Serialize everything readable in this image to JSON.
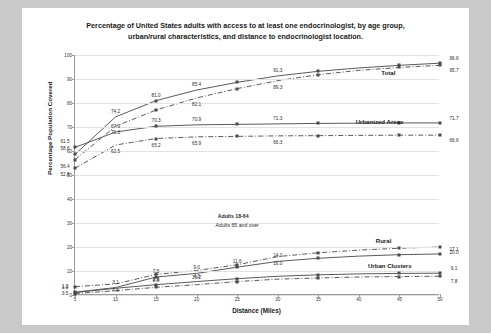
{
  "chart_data": {
    "type": "line",
    "title": "Percentage of United States adults with access to at least one endocrinologist, by age group, urban/rural characteristics, and distance to endocrinologist location.",
    "title_line1": "Percentage of United States adults with access to at least one endocrinologist, by age group,",
    "title_line2": "urban/rural characteristics, and distance to endocrinologist location.",
    "xlabel": "Distance (Miles)",
    "ylabel": "Percentage Population Covered",
    "xlim": [
      5,
      50
    ],
    "ylim": [
      0,
      100
    ],
    "x": [
      5,
      10,
      15,
      20,
      25,
      30,
      35,
      40,
      45,
      50
    ],
    "xticks": [
      "5",
      "10",
      "15",
      "20",
      "25",
      "30",
      "35",
      "40",
      "45",
      "50"
    ],
    "yticks": [
      "0",
      "10",
      "20",
      "30",
      "40",
      "50",
      "60",
      "70",
      "80",
      "90",
      "100"
    ],
    "grid": true,
    "legend_position": "center",
    "legend": [
      "Adults 18-64",
      "Adults 65 and over"
    ],
    "group_labels": [
      "Total",
      "Urbanized Areas",
      "Rural",
      "Urban Clusters"
    ],
    "series": [
      {
        "name": "Total - Adults 18-64",
        "group": "Total",
        "style": "solid",
        "values": [
          58.6,
          74.2,
          81.0,
          85.4,
          88.6,
          91.3,
          93.2,
          94.6,
          95.7,
          96.6
        ],
        "labels": {
          "5": "58.6",
          "10": "74.2",
          "15": "81.0",
          "20": "85.4",
          "30": "91.3",
          "50": "96.6"
        }
      },
      {
        "name": "Total - Adults 65 and over",
        "group": "Total",
        "style": "dashdot",
        "values": [
          56.4,
          70.3,
          77.1,
          82.1,
          86.0,
          89.3,
          91.8,
          93.6,
          94.8,
          95.7
        ],
        "labels": {
          "5": "56.4",
          "10": "70.3",
          "20": "82.1",
          "30": "89.3",
          "50": "95.7"
        }
      },
      {
        "name": "Urbanized Areas - Adults 18-64",
        "group": "Urbanized Areas",
        "style": "solid",
        "values": [
          61.5,
          67.9,
          70.3,
          70.9,
          71.1,
          71.3,
          71.5,
          71.6,
          71.7,
          71.7
        ],
        "labels": {
          "5": "61.5",
          "10": "67.9",
          "15": "70.3",
          "20": "70.9",
          "30": "71.3",
          "50": "71.7"
        }
      },
      {
        "name": "Urbanized Areas - Adults 65 and over",
        "group": "Urbanized Areas",
        "style": "dashdot",
        "values": [
          52.8,
          62.5,
          65.2,
          65.9,
          66.1,
          66.3,
          66.4,
          66.5,
          66.6,
          66.6
        ],
        "labels": {
          "5": "52.8",
          "10": "62.5",
          "15": "65.2",
          "20": "65.9",
          "30": "66.3",
          "50": "66.6"
        }
      },
      {
        "name": "Rural - Adults 65 and over",
        "group": "Rural",
        "style": "dashdot",
        "values": [
          3.5,
          4.6,
          8.6,
          10.2,
          12.6,
          16.0,
          17.6,
          18.7,
          19.5,
          20.0
        ],
        "labels": {
          "5": "3.5",
          "10": "4.6",
          "15": "8.6",
          "20": "10.2",
          "30": "16.0",
          "50": "20.0"
        }
      },
      {
        "name": "Rural - Adults 18-64",
        "group": "Rural",
        "style": "solid",
        "values": [
          1.2,
          3.1,
          7.5,
          9.0,
          11.6,
          14.0,
          15.3,
          16.2,
          16.8,
          17.1
        ],
        "labels": {
          "5": "1.2",
          "10": "3.1",
          "15": "7.5",
          "20": "9.0",
          "25": "11.6",
          "30": "14.0",
          "50": "17.1"
        }
      },
      {
        "name": "Urban Clusters - Adults 18-64",
        "group": "Urban Clusters",
        "style": "solid",
        "values": [
          1.0,
          2.8,
          4.3,
          5.6,
          6.8,
          7.8,
          8.4,
          8.8,
          9.0,
          9.1
        ],
        "labels": {
          "5": "1.0",
          "15": "2.8",
          "20": "4.3",
          "50": "9.1"
        }
      },
      {
        "name": "Urban Clusters - Adults 65 and over",
        "group": "Urban Clusters",
        "style": "dashdot",
        "values": [
          0.6,
          1.8,
          3.2,
          4.3,
          5.6,
          6.6,
          7.1,
          7.5,
          7.7,
          7.8
        ],
        "labels": {
          "50": "7.8"
        }
      }
    ],
    "annotations": [
      {
        "text": "Total",
        "x": 44.5,
        "y": 93.0
      },
      {
        "text": "Urbanized Areas",
        "x": 45.5,
        "y": 72.5
      },
      {
        "text": "Rural",
        "x": 44.0,
        "y": 23.0
      },
      {
        "text": "Urban Clusters",
        "x": 46.5,
        "y": 12.5
      },
      {
        "text": "Adults 18-64",
        "x": 24.5,
        "y": 33.0
      },
      {
        "text": "Adults 65 and over",
        "x": 25.0,
        "y": 29.0
      }
    ]
  },
  "colors": {
    "background": "#c9c9c9",
    "card": "#ffffff",
    "grid": "#e2e2e2",
    "axis": "#9a9a9a",
    "line": "#5a5a5a",
    "text": "#1a1a1a"
  }
}
